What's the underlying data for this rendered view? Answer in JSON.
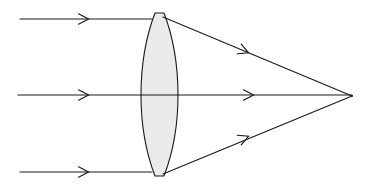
{
  "figure": {
    "kind": "optics-ray-diagram",
    "canvas": {
      "width": 371,
      "height": 187
    },
    "background_color": "#ffffff",
    "stroke_color": "#1a1a1a",
    "lens_fill_color": "#ebebeb",
    "lens_stroke_color": "#1a1a1a",
    "stroke_width": 1.1
  },
  "optical_axis": {
    "label": "optical-axis",
    "y": 95,
    "x_start": 18,
    "x_end": 352
  },
  "lens": {
    "label": "biconvex-lens",
    "center_x": 159.5,
    "center_y": 95,
    "top_y": 13,
    "bottom_y": 176,
    "half_height": 81.5,
    "left_vertex_x": 141,
    "right_vertex_x": 178,
    "max_thickness": 37,
    "edge_thickness": 9,
    "flat_cap_half_width": 4.5
  },
  "incoming_rays": [
    {
      "name": "incoming-ray-top",
      "y": 19,
      "x_start": 20,
      "x_end": 152,
      "arrow_x": 88
    },
    {
      "name": "incoming-ray-middle",
      "y": 95,
      "x_start": 18,
      "x_end": 141,
      "arrow_x": 88
    },
    {
      "name": "incoming-ray-bottom",
      "y": 172,
      "x_start": 20,
      "x_end": 152,
      "arrow_x": 88
    }
  ],
  "refracted_rays": [
    {
      "name": "refracted-ray-top",
      "x_start": 163,
      "y_start": 17,
      "x_end": 352,
      "y_end": 96,
      "arrow_x": 248,
      "arrow_y": 52.6
    },
    {
      "name": "refracted-ray-middle",
      "x_start": 178,
      "y_start": 95,
      "x_end": 352,
      "y_end": 95,
      "arrow_x": 253,
      "arrow_y": 95
    },
    {
      "name": "refracted-ray-bottom",
      "x_start": 163,
      "y_start": 174,
      "x_end": 352,
      "y_end": 96,
      "arrow_x": 248,
      "arrow_y": 136.4
    }
  ],
  "focal_point": {
    "name": "focal-point",
    "x": 352,
    "y": 96
  }
}
